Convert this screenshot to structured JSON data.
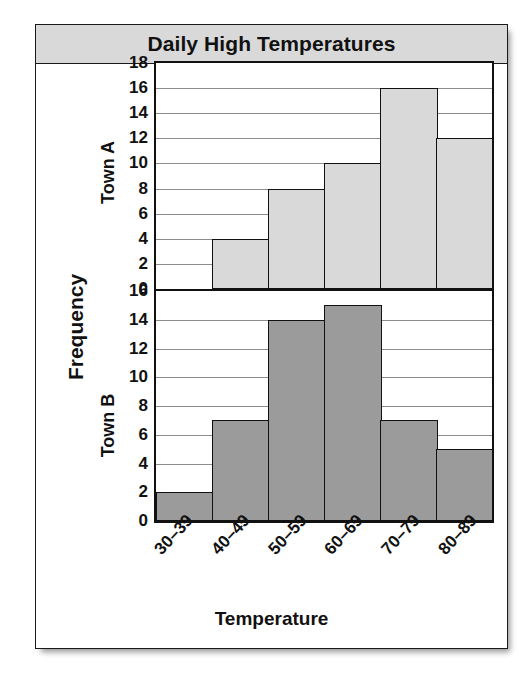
{
  "figure": {
    "title": "Daily High Temperatures",
    "x_axis_label": "Temperature",
    "y_axis_label": "Frequency"
  },
  "panels": [
    {
      "label": "Town A"
    },
    {
      "label": "Town B"
    }
  ],
  "colors": {
    "title_banner_bg": "#d9d9d9",
    "town_a_bar": "#d9d9d9",
    "town_b_bar": "#9b9b9b",
    "outline": "#111111",
    "gridline": "#8d8d8d",
    "panel_bg": "#ffffff"
  },
  "x_tick_labels": [
    "30–39",
    "40–49",
    "50–59",
    "60–69",
    "70–79",
    "80–89"
  ],
  "town_a_ticks": [
    "0",
    "2",
    "4",
    "6",
    "8",
    "10",
    "12",
    "14",
    "16",
    "18"
  ],
  "town_b_ticks": [
    "0",
    "2",
    "4",
    "6",
    "8",
    "10",
    "12",
    "14",
    "16"
  ],
  "chart_data": {
    "type": "bar",
    "title": "Daily High Temperatures",
    "xlabel": "Temperature",
    "ylabel": "Frequency",
    "categories": [
      "30–39",
      "40–49",
      "50–59",
      "60–69",
      "70–79",
      "80–89"
    ],
    "grid": true,
    "legend": "none",
    "panels": [
      {
        "name": "Town A",
        "values": [
          0,
          4,
          8,
          10,
          16,
          12
        ],
        "ylim": [
          0,
          18
        ],
        "ytick_step": 2,
        "yticks": [
          0,
          2,
          4,
          6,
          8,
          10,
          12,
          14,
          16,
          18
        ],
        "bar_fill": "#d9d9d9"
      },
      {
        "name": "Town B",
        "values": [
          2,
          7,
          14,
          15,
          7,
          5
        ],
        "ylim": [
          0,
          16
        ],
        "ytick_step": 2,
        "yticks": [
          0,
          2,
          4,
          6,
          8,
          10,
          12,
          14,
          16
        ],
        "bar_fill": "#9b9b9b"
      }
    ]
  }
}
